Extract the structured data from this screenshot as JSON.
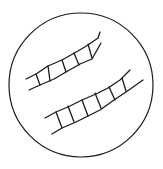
{
  "diagram": {
    "description": "Circular field of view containing two ladder-like cell chains",
    "stroke_color": "#1a1a1a",
    "background": "#ffffff",
    "circle": {
      "cx": 81,
      "cy": 85,
      "r": 72
    },
    "chains": [
      {
        "name": "upper-chain",
        "top_rail": "M26,79 L36,74 L48,66 L62,60 L78,51 L88,45 L98,38 L100,32",
        "bottom_rail": "M29,90 L40,85 L54,79 L66,72 L80,64 L92,59 L101,43",
        "rungs": [
          [
            36,
            74,
            40,
            85
          ],
          [
            48,
            66,
            50,
            81
          ],
          [
            62,
            60,
            66,
            72
          ],
          [
            74,
            53,
            79,
            65
          ],
          [
            88,
            44,
            92,
            58
          ]
        ]
      },
      {
        "name": "lower-chain",
        "top_rail": "M45,118 L56,112 L70,106 L82,100 L96,94 L108,88 L120,80 L130,70",
        "bottom_rail": "M52,134 L62,128 L76,122 L88,116 L100,110 L114,100 L126,92 L143,80",
        "rungs": [
          [
            56,
            112,
            62,
            128
          ],
          [
            68,
            106,
            74,
            122
          ],
          [
            82,
            100,
            88,
            116
          ],
          [
            95,
            93,
            101,
            108
          ],
          [
            109,
            87,
            115,
            100
          ],
          [
            122,
            78,
            126,
            91
          ]
        ]
      }
    ]
  }
}
